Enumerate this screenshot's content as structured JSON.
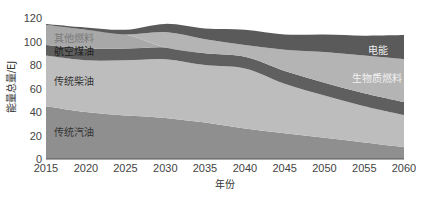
{
  "chart_data": {
    "type": "area",
    "stacked": true,
    "title": "",
    "xlabel": "年份",
    "ylabel": "能量总量/EJ",
    "xlim": [
      2015,
      2060
    ],
    "ylim": [
      0,
      120
    ],
    "x": [
      2015,
      2020,
      2025,
      2030,
      2035,
      2040,
      2045,
      2050,
      2055,
      2060
    ],
    "x_ticks": [
      "2015",
      "2020",
      "2025",
      "2030",
      "2035",
      "2040",
      "2045",
      "2050",
      "2055",
      "2060"
    ],
    "y_ticks": [
      "0",
      "20",
      "40",
      "60",
      "80",
      "100",
      "120"
    ],
    "grid": false,
    "legend": "inline labels",
    "series": [
      {
        "name": "传统汽油",
        "color": "#8f8f8f",
        "label_color": "#333333",
        "values": [
          45,
          40,
          37,
          35,
          31,
          26,
          22,
          18,
          14,
          10
        ]
      },
      {
        "name": "传统柴油",
        "color": "#bdbdbd",
        "label_color": "#333333",
        "values": [
          43,
          44,
          47,
          50,
          49,
          51,
          42,
          36,
          31,
          27.5
        ]
      },
      {
        "name": "航空煤油",
        "color": "#5f5f5f",
        "label_color": "#222222",
        "values": [
          9,
          10,
          10,
          10,
          10,
          10,
          11,
          11,
          11,
          11
        ]
      },
      {
        "name": "其他燃料",
        "color": "#a8a8a8",
        "label_color": "#777777",
        "values": [
          17,
          16,
          12,
          0,
          0,
          0,
          0,
          0,
          0,
          0
        ]
      },
      {
        "name": "生物质燃料",
        "color": "#b4b4b4",
        "label_color": "#f2f2f2",
        "values": [
          0,
          0,
          0,
          13,
          12,
          10,
          18,
          26,
          32,
          36.5
        ]
      },
      {
        "name": "电能",
        "color": "#5a5a5a",
        "label_color": "#eeeeee",
        "values": [
          1,
          2,
          4,
          7,
          9,
          13,
          13,
          15,
          17,
          20.5
        ]
      }
    ],
    "totals": [
      115,
      112,
      110,
      115,
      111,
      110,
      106,
      106,
      105,
      105.5
    ]
  },
  "labels": {
    "gasoline": "传统汽油",
    "diesel": "传统柴油",
    "jet": "航空煤油",
    "other": "其他燃料",
    "bio": "生物质燃料",
    "electric": "电能"
  },
  "axes": {
    "xlabel": "年份",
    "ylabel": "能量总量/EJ",
    "x_ticks": [
      "2015",
      "2020",
      "2025",
      "2030",
      "2035",
      "2040",
      "2045",
      "2050",
      "2055",
      "2060"
    ],
    "y_ticks": [
      "0",
      "20",
      "40",
      "60",
      "80",
      "100",
      "120"
    ]
  }
}
